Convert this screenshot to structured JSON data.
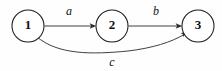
{
  "diagram": {
    "type": "directed-graph",
    "background_color": "#fefefe",
    "stroke_color": "#2b2b2b",
    "node_fill": "#ffffff",
    "nodes": [
      {
        "id": "1",
        "label": "1",
        "cx": 28,
        "cy": 26,
        "r": 16
      },
      {
        "id": "2",
        "label": "2",
        "cx": 112,
        "cy": 26,
        "r": 16
      },
      {
        "id": "3",
        "label": "3",
        "cx": 198,
        "cy": 26,
        "r": 16
      }
    ],
    "edges": [
      {
        "id": "a",
        "label": "a",
        "from": "1",
        "to": "2",
        "shape": "straight",
        "label_x": 69,
        "label_y": 12
      },
      {
        "id": "b",
        "label": "b",
        "from": "2",
        "to": "3",
        "shape": "straight",
        "label_x": 156,
        "label_y": 12
      },
      {
        "id": "c",
        "label": "c",
        "from": "1",
        "to": "3",
        "shape": "curve",
        "label_x": 112,
        "label_y": 63
      }
    ]
  }
}
